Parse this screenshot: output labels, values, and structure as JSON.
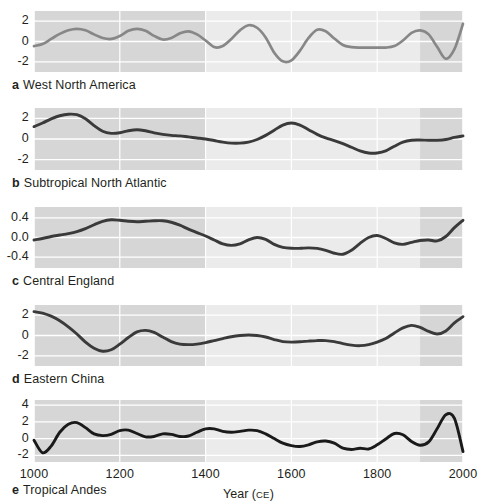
{
  "figure": {
    "xaxis": {
      "title_main": "Year (",
      "title_smallcaps": "CE",
      "title_end": ")",
      "title_full": "Year (CE)",
      "ticks": [
        "1000",
        "1200",
        "1400",
        "1600",
        "1800",
        "2000"
      ],
      "range": [
        1000,
        2000
      ]
    },
    "highlight_band": {
      "start": 1400,
      "end": 1900,
      "color": "#f2f2f2"
    },
    "colors": {
      "panel_bg": "#d6d6d6",
      "gridline": "#ffffff",
      "curve_a": "#878787",
      "curve_default": "#3a3a3a",
      "text": "#231f20"
    }
  },
  "chart_data": {
    "type": "line",
    "title": "",
    "xlabel": "Year (CE)",
    "ylabel": "",
    "xlim": [
      1000,
      2000
    ],
    "grid": true,
    "legend": "none",
    "panels": [
      {
        "letter": "a",
        "label": "West North America",
        "ylabel": "",
        "yticks": [
          -2,
          0,
          2
        ],
        "ytick_labels": [
          "-2",
          "0",
          "2"
        ],
        "ylim": [
          -3.0,
          3.0
        ],
        "color": "#878787",
        "x": [
          1000,
          1020,
          1040,
          1060,
          1080,
          1100,
          1120,
          1140,
          1160,
          1180,
          1200,
          1220,
          1240,
          1260,
          1280,
          1300,
          1320,
          1340,
          1360,
          1380,
          1400,
          1420,
          1440,
          1460,
          1480,
          1500,
          1520,
          1540,
          1560,
          1580,
          1600,
          1620,
          1640,
          1660,
          1680,
          1700,
          1720,
          1740,
          1760,
          1780,
          1800,
          1820,
          1840,
          1860,
          1880,
          1900,
          1920,
          1940,
          1960,
          1980,
          2000
        ],
        "y": [
          -0.45,
          -0.25,
          0.25,
          0.75,
          1.1,
          1.25,
          1.1,
          0.7,
          0.35,
          0.25,
          0.55,
          1.05,
          1.25,
          1.05,
          0.55,
          0.2,
          0.35,
          0.8,
          1.0,
          0.7,
          0.1,
          -0.55,
          -0.45,
          0.25,
          1.1,
          1.6,
          1.35,
          0.4,
          -1.1,
          -1.95,
          -1.85,
          -0.9,
          0.35,
          1.15,
          1.0,
          0.3,
          -0.35,
          -0.55,
          -0.6,
          -0.6,
          -0.6,
          -0.6,
          -0.45,
          0.1,
          0.85,
          1.1,
          0.7,
          -0.55,
          -1.7,
          -0.75,
          1.75
        ]
      },
      {
        "letter": "b",
        "label": "Subtropical North Atlantic",
        "ylabel": "",
        "yticks": [
          -2,
          0,
          2
        ],
        "ytick_labels": [
          "-2",
          "0",
          "2"
        ],
        "ylim": [
          -3.0,
          3.0
        ],
        "color": "#3a3a3a",
        "x": [
          1000,
          1020,
          1040,
          1060,
          1080,
          1100,
          1120,
          1140,
          1160,
          1180,
          1200,
          1220,
          1240,
          1260,
          1280,
          1300,
          1320,
          1340,
          1360,
          1380,
          1400,
          1420,
          1440,
          1460,
          1480,
          1500,
          1520,
          1540,
          1560,
          1580,
          1600,
          1620,
          1640,
          1660,
          1680,
          1700,
          1720,
          1740,
          1760,
          1780,
          1800,
          1820,
          1840,
          1860,
          1880,
          1900,
          1920,
          1940,
          1960,
          1980,
          2000
        ],
        "y": [
          1.2,
          1.55,
          1.95,
          2.25,
          2.4,
          2.35,
          1.95,
          1.3,
          0.75,
          0.55,
          0.6,
          0.8,
          0.9,
          0.8,
          0.6,
          0.45,
          0.35,
          0.3,
          0.2,
          0.1,
          0.0,
          -0.15,
          -0.3,
          -0.4,
          -0.4,
          -0.3,
          -0.05,
          0.35,
          0.85,
          1.35,
          1.55,
          1.35,
          0.9,
          0.45,
          0.1,
          -0.15,
          -0.45,
          -0.8,
          -1.15,
          -1.35,
          -1.35,
          -1.15,
          -0.7,
          -0.3,
          -0.12,
          -0.1,
          -0.12,
          -0.12,
          -0.05,
          0.15,
          0.3
        ]
      },
      {
        "letter": "c",
        "label": "Central England",
        "ylabel": "",
        "yticks": [
          -0.4,
          0.0,
          0.4
        ],
        "ytick_labels": [
          "-0.4",
          "0.0",
          "0.4"
        ],
        "ylim": [
          -0.62,
          0.62
        ],
        "color": "#3a3a3a",
        "x": [
          1000,
          1020,
          1040,
          1060,
          1080,
          1100,
          1120,
          1140,
          1160,
          1180,
          1200,
          1220,
          1240,
          1260,
          1280,
          1300,
          1320,
          1340,
          1360,
          1380,
          1400,
          1420,
          1440,
          1460,
          1480,
          1500,
          1520,
          1540,
          1560,
          1580,
          1600,
          1620,
          1640,
          1660,
          1680,
          1700,
          1720,
          1740,
          1760,
          1780,
          1800,
          1820,
          1840,
          1860,
          1880,
          1900,
          1920,
          1940,
          1960,
          1980,
          2000
        ],
        "y": [
          -0.05,
          -0.02,
          0.02,
          0.05,
          0.08,
          0.12,
          0.18,
          0.26,
          0.33,
          0.36,
          0.35,
          0.33,
          0.32,
          0.33,
          0.34,
          0.34,
          0.31,
          0.25,
          0.17,
          0.1,
          0.03,
          -0.05,
          -0.13,
          -0.16,
          -0.13,
          -0.05,
          0.0,
          -0.04,
          -0.14,
          -0.2,
          -0.22,
          -0.22,
          -0.21,
          -0.22,
          -0.26,
          -0.32,
          -0.34,
          -0.26,
          -0.12,
          0.0,
          0.04,
          -0.02,
          -0.11,
          -0.14,
          -0.1,
          -0.06,
          -0.05,
          -0.07,
          0.02,
          0.2,
          0.35
        ]
      },
      {
        "letter": "d",
        "label": "Eastern China",
        "ylabel": "",
        "yticks": [
          -2,
          0,
          2
        ],
        "ytick_labels": [
          "-2",
          "0",
          "2"
        ],
        "ylim": [
          -3.0,
          3.0
        ],
        "color": "#3a3a3a",
        "x": [
          1000,
          1020,
          1040,
          1060,
          1080,
          1100,
          1120,
          1140,
          1160,
          1180,
          1200,
          1220,
          1240,
          1260,
          1280,
          1300,
          1320,
          1340,
          1360,
          1380,
          1400,
          1420,
          1440,
          1460,
          1480,
          1500,
          1520,
          1540,
          1560,
          1580,
          1600,
          1620,
          1640,
          1660,
          1680,
          1700,
          1720,
          1740,
          1760,
          1780,
          1800,
          1820,
          1840,
          1860,
          1880,
          1900,
          1920,
          1940,
          1960,
          1980,
          2000
        ],
        "y": [
          2.35,
          2.2,
          1.9,
          1.45,
          0.85,
          0.15,
          -0.65,
          -1.25,
          -1.55,
          -1.4,
          -0.85,
          -0.2,
          0.35,
          0.5,
          0.3,
          -0.15,
          -0.6,
          -0.85,
          -0.9,
          -0.85,
          -0.7,
          -0.5,
          -0.3,
          -0.12,
          0.0,
          0.05,
          0.0,
          -0.15,
          -0.4,
          -0.6,
          -0.65,
          -0.62,
          -0.55,
          -0.5,
          -0.5,
          -0.6,
          -0.8,
          -0.95,
          -1.0,
          -0.9,
          -0.65,
          -0.3,
          0.25,
          0.75,
          1.0,
          0.8,
          0.4,
          0.15,
          0.45,
          1.25,
          1.85
        ]
      },
      {
        "letter": "e",
        "label": "Tropical Andes",
        "ylabel": "",
        "yticks": [
          -2,
          0,
          2,
          4
        ],
        "ytick_labels": [
          "-2",
          "0",
          "2",
          "4"
        ],
        "ylim": [
          -2.8,
          4.6
        ],
        "color": "#1a1a1a",
        "x": [
          1000,
          1020,
          1040,
          1060,
          1080,
          1100,
          1120,
          1140,
          1160,
          1180,
          1200,
          1220,
          1240,
          1260,
          1280,
          1300,
          1320,
          1340,
          1360,
          1380,
          1400,
          1420,
          1440,
          1460,
          1480,
          1500,
          1520,
          1540,
          1560,
          1580,
          1600,
          1620,
          1640,
          1660,
          1680,
          1700,
          1720,
          1740,
          1760,
          1780,
          1800,
          1820,
          1840,
          1860,
          1880,
          1900,
          1920,
          1940,
          1960,
          1980,
          2000
        ],
        "y": [
          -0.2,
          -1.7,
          -0.9,
          0.75,
          1.7,
          1.9,
          1.3,
          0.55,
          0.35,
          0.5,
          0.95,
          1.0,
          0.6,
          0.2,
          0.25,
          0.55,
          0.5,
          0.25,
          0.3,
          0.75,
          1.15,
          1.15,
          0.85,
          0.75,
          0.85,
          1.0,
          0.95,
          0.55,
          0.0,
          -0.55,
          -0.85,
          -0.95,
          -0.75,
          -0.4,
          -0.3,
          -0.55,
          -1.15,
          -1.3,
          -1.15,
          -1.25,
          -0.75,
          -0.05,
          0.6,
          0.45,
          -0.35,
          -0.8,
          -0.4,
          1.2,
          2.85,
          2.4,
          -1.55
        ]
      }
    ]
  }
}
